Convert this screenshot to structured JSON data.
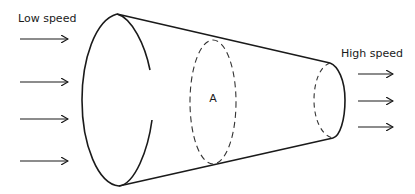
{
  "diagram": {
    "labels": {
      "inlet": "Low speed",
      "outlet": "High speed",
      "section": "A"
    },
    "inlet_arrows": 4,
    "outlet_arrows": 3,
    "colors": {
      "stroke": "#1a1a1a",
      "background": "#ffffff"
    }
  }
}
